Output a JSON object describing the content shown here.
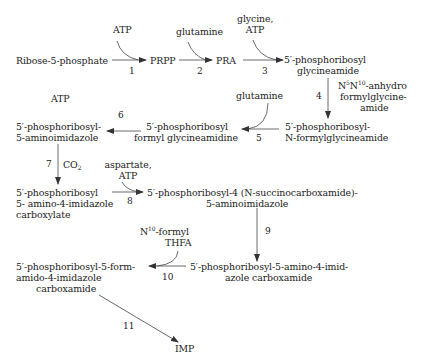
{
  "diagram": {
    "compounds": {
      "ribose5p": "Ribose-5-phosphate",
      "prpp": "PRPP",
      "pra": "PRA",
      "gar_1": "5′-phosphoribosyl",
      "gar_2": "glycineamide",
      "fgar_1": "5′-phosphoribosyl-",
      "fgar_2": "N-formylglycineamide",
      "fgam_1": "5′-phosphoribosyl",
      "fgam_2": "formyl glycineamidine",
      "air_1": "5′-phosphoribosyl-",
      "air_2": "5-aminoimidazole",
      "cair_1": "5′-phosphoribosyl",
      "cair_2": "5- amino-4-imidazole",
      "cair_3": "carboxylate",
      "saicar_1": "5′-phosphoribosyl-4 (N-succinocarboxamide)-",
      "saicar_2": "5-aminoimidazole",
      "aicar_1": "5′-phosphoribosyl-5-amino-4-imid-",
      "aicar_2": "azole carboxamide",
      "faicar_1": "5′-phosphoribosyl-5-form-",
      "faicar_2": "amido-4-imidazole",
      "faicar_3": "carboxamide",
      "imp": "IMP"
    },
    "cofactors": {
      "step1": "ATP",
      "step2": "glutamine",
      "step3_1": "glycine,",
      "step3_2": "ATP",
      "step4_1a": "N",
      "step4_1sup1": "5",
      "step4_1b": "N",
      "step4_1sup2": "10",
      "step4_1c": "-anhydro",
      "step4_2": "formylglycine-",
      "step4_3": "amide",
      "step5": "glutamine",
      "step6": "ATP",
      "step7_a": "CO",
      "step7_sub": "2",
      "step8_1": "aspartate,",
      "step8_2": "ATP",
      "step10_1a": "N",
      "step10_1sup": "10",
      "step10_1b": "-formyl",
      "step10_2": "THFA"
    },
    "steps": [
      "1",
      "2",
      "3",
      "4",
      "5",
      "6",
      "7",
      "8",
      "9",
      "10",
      "11"
    ],
    "colors": {
      "text": "#222222",
      "arrow": "#333333",
      "background": "#ffffff"
    }
  }
}
